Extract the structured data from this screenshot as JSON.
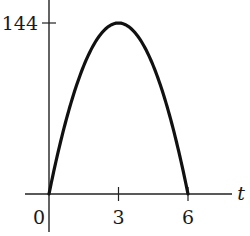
{
  "chart_data": {
    "type": "line",
    "title": "",
    "xlabel": "t",
    "ylabel": "",
    "x_ticks": [
      0,
      3,
      6
    ],
    "x_tick_labels": [
      "0",
      "3",
      "6"
    ],
    "y_ticks": [
      144
    ],
    "y_tick_labels": [
      "144"
    ],
    "xlim": [
      -0.7,
      6.7
    ],
    "ylim": [
      -20,
      170
    ],
    "grid": false,
    "legend": null,
    "series": [
      {
        "name": "h(t) = 16t(6 - t)",
        "x": [
          0,
          0.5,
          1,
          1.5,
          2,
          2.5,
          3,
          3.5,
          4,
          4.5,
          5,
          5.5,
          6
        ],
        "values": [
          0,
          44,
          80,
          108,
          128,
          140,
          144,
          140,
          128,
          108,
          80,
          44,
          0
        ]
      }
    ],
    "colors": {
      "curve": "#111111",
      "axes": "#222222",
      "text": "#1a1a1a"
    }
  }
}
